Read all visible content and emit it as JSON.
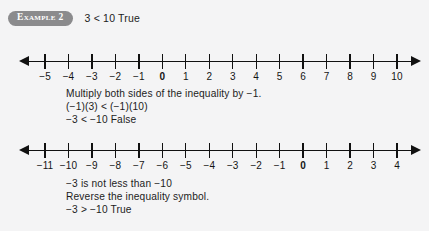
{
  "page": {
    "background_color": "#f4f4f5",
    "text_color": "#1c1c1c"
  },
  "example": {
    "badge_label": "Example 2",
    "badge_color": "#8b8b8d",
    "statement": "3 < 10  True"
  },
  "number_lines": [
    {
      "id": "numberline-1",
      "name": "number-line-top",
      "min": -5,
      "max": 10,
      "zero_bold": true,
      "left_arrow": true,
      "right_arrow": true,
      "labels": [
        "−5",
        "−4",
        "−3",
        "−2",
        "−1",
        "0",
        "1",
        "2",
        "3",
        "4",
        "5",
        "6",
        "7",
        "8",
        "9",
        "10"
      ]
    },
    {
      "id": "numberline-2",
      "name": "number-line-bottom",
      "min": -11,
      "max": 4,
      "zero_bold": true,
      "left_arrow": true,
      "right_arrow": true,
      "labels": [
        "−11",
        "−10",
        "−9",
        "−8",
        "−7",
        "−6",
        "−5",
        "−4",
        "−3",
        "−2",
        "−1",
        "0",
        "1",
        "2",
        "3",
        "4"
      ]
    }
  ],
  "middle_text": {
    "line1": "Multiply both sides of the inequality by −1.",
    "line2": "(−1)(3) < (−1)(10)",
    "line3": "−3 < −10  False"
  },
  "bottom_text": {
    "line1": "−3 is not less than −10",
    "line2": "Reverse the inequality symbol.",
    "line3": "−3 > −10  True"
  }
}
